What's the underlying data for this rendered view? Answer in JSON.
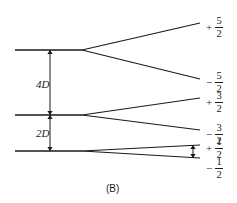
{
  "figure": {
    "caption": "(B)",
    "caption_x": 106,
    "caption_y": 183,
    "background": "#ffffff",
    "line_color": "#1a1a1a"
  },
  "gap_labels": [
    {
      "text": "4D",
      "x": 36,
      "y": 78
    },
    {
      "text": "2D",
      "x": 36,
      "y": 127
    }
  ],
  "level_labels": [
    {
      "sign": "+",
      "num": "5",
      "den": "2",
      "x": 205,
      "y": 16
    },
    {
      "sign": "−",
      "num": "5",
      "den": "2",
      "x": 205,
      "y": 71
    },
    {
      "sign": "+",
      "num": "3",
      "den": "2",
      "x": 205,
      "y": 91
    },
    {
      "sign": "−",
      "num": "3",
      "den": "2",
      "x": 205,
      "y": 123
    },
    {
      "sign": "+",
      "num": "1",
      "den": "2",
      "x": 205,
      "y": 137
    },
    {
      "sign": "−",
      "num": "1",
      "den": "2",
      "x": 205,
      "y": 157
    }
  ],
  "chart_data": {
    "type": "line",
    "title": "(B)",
    "xlabel": "",
    "ylabel": "",
    "xlim": [
      0,
      237
    ],
    "ylim": [
      203,
      0
    ],
    "grid": false,
    "legend": null,
    "unsplit_levels": [
      {
        "name": "level-top",
        "y": 50,
        "x_start": 15,
        "x_end": 82,
        "gap_below_label": "4D"
      },
      {
        "name": "level-middle",
        "y": 115,
        "x_start": 15,
        "x_end": 82,
        "gap_below_label": "2D"
      },
      {
        "name": "level-bottom",
        "y": 151,
        "x_start": 15,
        "x_end": 82,
        "gap_below_label": null
      }
    ],
    "split_branches": [
      {
        "from_level": "level-top",
        "x1": 82,
        "y1": 50,
        "x2": 200,
        "y2": 23,
        "label": "+5/2"
      },
      {
        "from_level": "level-top",
        "x1": 82,
        "y1": 50,
        "x2": 200,
        "y2": 79,
        "label": "-5/2"
      },
      {
        "from_level": "level-middle",
        "x1": 82,
        "y1": 115,
        "x2": 200,
        "y2": 98,
        "label": "+3/2"
      },
      {
        "from_level": "level-middle",
        "x1": 82,
        "y1": 115,
        "x2": 200,
        "y2": 130,
        "label": "-3/2"
      },
      {
        "from_level": "level-bottom",
        "x1": 82,
        "y1": 151,
        "x2": 200,
        "y2": 145,
        "label": "+1/2"
      },
      {
        "from_level": "level-bottom",
        "x1": 82,
        "y1": 151,
        "x2": 200,
        "y2": 158,
        "label": "-1/2"
      }
    ],
    "gap_arrows": [
      {
        "name": "arrow-4D",
        "x": 50,
        "y_top": 50,
        "y_bottom": 115,
        "label": "4D"
      },
      {
        "name": "arrow-2D",
        "x": 50,
        "y_top": 115,
        "y_bottom": 151,
        "label": "2D"
      },
      {
        "name": "arrow-small-split",
        "x": 193,
        "y_top": 145,
        "y_bottom": 158,
        "label": ""
      }
    ]
  }
}
